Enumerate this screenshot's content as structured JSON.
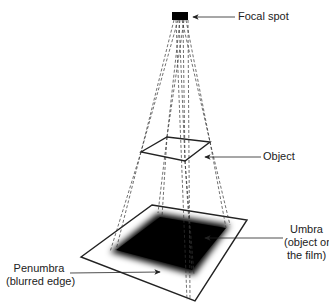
{
  "diagram": {
    "labels": {
      "focal_spot": "Focal spot",
      "object": "Object",
      "umbra_line1": "Umbra",
      "umbra_line2": "(object on",
      "umbra_line3": "the film)",
      "penumbra_line1": "Penumbra",
      "penumbra_line2": "(blurred edge)"
    },
    "colors": {
      "line": "#222222",
      "umbra": "#000000",
      "background": "#ffffff"
    }
  }
}
